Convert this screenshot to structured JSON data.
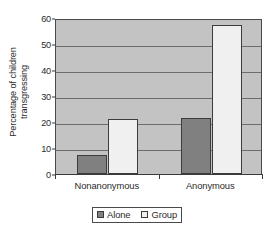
{
  "chart_data": {
    "type": "bar",
    "title": "",
    "xlabel": "",
    "ylabel": "Percentage of children transgressing",
    "ylabel_line1": "Percentage of children",
    "ylabel_line2": "transgressing",
    "categories": [
      "Nonanonymous",
      "Anonymous"
    ],
    "series": [
      {
        "name": "Alone",
        "values": [
          7.5,
          21.5
        ],
        "color": "#808080"
      },
      {
        "name": "Group",
        "values": [
          21,
          57.5
        ],
        "color": "#f0f0f0"
      }
    ],
    "ylim": [
      0,
      60
    ],
    "yticks": [
      0,
      10,
      20,
      30,
      40,
      50,
      60
    ],
    "ytick_labels": [
      "0",
      "10",
      "20",
      "30",
      "40",
      "50",
      "60"
    ],
    "grid": true,
    "grid_axis": "y",
    "legend_position": "bottom",
    "plot_background": "#c3c3c3",
    "axis_color": "#3a3a3a"
  },
  "legend": {
    "items": [
      {
        "label": "Alone",
        "color": "#808080"
      },
      {
        "label": "Group",
        "color": "#f0f0f0"
      }
    ]
  }
}
